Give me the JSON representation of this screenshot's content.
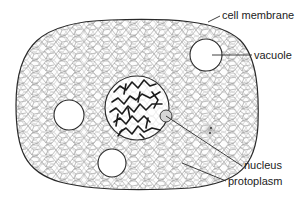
{
  "diagram": {
    "colors": {
      "ink": "#2a2a2a",
      "texture": "#8a8a8a",
      "background": "#ffffff"
    },
    "labels": [
      {
        "id": "cell-membrane",
        "text": "cell membrane",
        "x": 222,
        "y": 10
      },
      {
        "id": "vacuole",
        "text": "vacuole",
        "x": 254,
        "y": 50
      },
      {
        "id": "nucleus",
        "text": "nucleus",
        "x": 244,
        "y": 160
      },
      {
        "id": "protoplasm",
        "text": "protoplasm",
        "x": 228,
        "y": 176
      }
    ]
  }
}
